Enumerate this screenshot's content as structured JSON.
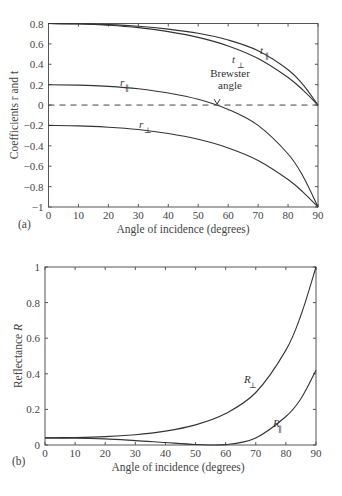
{
  "chart_data": [
    {
      "panel": "(a)",
      "type": "line",
      "title": "",
      "xlabel": "Angle of incidence (degrees)",
      "ylabel": "Coefficients r and t",
      "xlim": [
        0,
        90
      ],
      "ylim": [
        -1,
        0.8
      ],
      "xticks": [
        0,
        10,
        20,
        30,
        40,
        50,
        60,
        70,
        80,
        90
      ],
      "yticks": [
        0.8,
        0.6,
        0.4,
        0.2,
        0,
        -0.2,
        -0.4,
        -0.6,
        -0.8,
        -1
      ],
      "ytick_labels": [
        "0.8",
        "0.6",
        "0.4",
        "0.2",
        "0",
        "−0.2",
        "−0.4",
        "−0.6",
        "−0.8",
        "−1"
      ],
      "x": [
        0,
        10,
        20,
        30,
        40,
        50,
        60,
        70,
        80,
        85,
        90
      ],
      "series": [
        {
          "name": "t∥",
          "label_main": "t",
          "label_sub": "∥",
          "values": [
            0.8,
            0.797,
            0.789,
            0.773,
            0.745,
            0.704,
            0.638,
            0.533,
            0.347,
            0.201,
            0.0
          ]
        },
        {
          "name": "t⊥",
          "label_main": "t",
          "label_sub": "⊥",
          "values": [
            0.8,
            0.796,
            0.783,
            0.76,
            0.721,
            0.664,
            0.58,
            0.457,
            0.27,
            0.146,
            0.0
          ]
        },
        {
          "name": "r∥",
          "label_main": "r",
          "label_sub": "∥",
          "values": [
            0.2,
            0.196,
            0.183,
            0.159,
            0.118,
            0.056,
            -0.043,
            -0.2,
            -0.48,
            -0.698,
            -1.0
          ]
        },
        {
          "name": "r⊥",
          "label_main": "r",
          "label_sub": "⊥",
          "values": [
            -0.2,
            -0.204,
            -0.217,
            -0.24,
            -0.279,
            -0.336,
            -0.42,
            -0.543,
            -0.73,
            -0.854,
            -1.0
          ]
        }
      ],
      "reference_line": {
        "y": 0,
        "style": "dashed"
      },
      "annotations": [
        {
          "text_line1": "Brewster",
          "text_line2": "angle",
          "x": 56.3,
          "y": 0
        }
      ]
    },
    {
      "panel": "(b)",
      "type": "line",
      "title": "",
      "xlabel": "Angle of incidence (degrees)",
      "ylabel": "Reflectance R",
      "xlim": [
        0,
        90
      ],
      "ylim": [
        0,
        1
      ],
      "xticks": [
        0,
        10,
        20,
        30,
        40,
        50,
        60,
        70,
        80,
        90
      ],
      "yticks": [
        0,
        0.2,
        0.4,
        0.6,
        0.8,
        1
      ],
      "ytick_labels": [
        "0",
        "0.2",
        "0.4",
        "0.6",
        "0.8",
        "1"
      ],
      "x": [
        0,
        10,
        20,
        30,
        40,
        50,
        60,
        70,
        80,
        85,
        90
      ],
      "series": [
        {
          "name": "R⊥",
          "label_main": "R",
          "label_sub": "⊥",
          "values": [
            0.04,
            0.042,
            0.047,
            0.058,
            0.078,
            0.113,
            0.177,
            0.295,
            0.533,
            0.729,
            1.0
          ]
        },
        {
          "name": "R∥",
          "label_main": "R",
          "label_sub": "∥",
          "values": [
            0.04,
            0.038,
            0.034,
            0.025,
            0.014,
            0.003,
            0.002,
            0.04,
            0.16,
            0.26,
            0.42
          ]
        }
      ]
    }
  ],
  "panels": {
    "a": {
      "tag": "(a)",
      "xlabel": "Angle of incidence (degrees)",
      "ylabel": "Coefficients r and t",
      "brewster1": "Brewster",
      "brewster2": "angle"
    },
    "b": {
      "tag": "(b)",
      "xlabel": "Angle of incidence (degrees)",
      "ylabel_main": "Reflectance ",
      "ylabel_var": "R"
    }
  }
}
